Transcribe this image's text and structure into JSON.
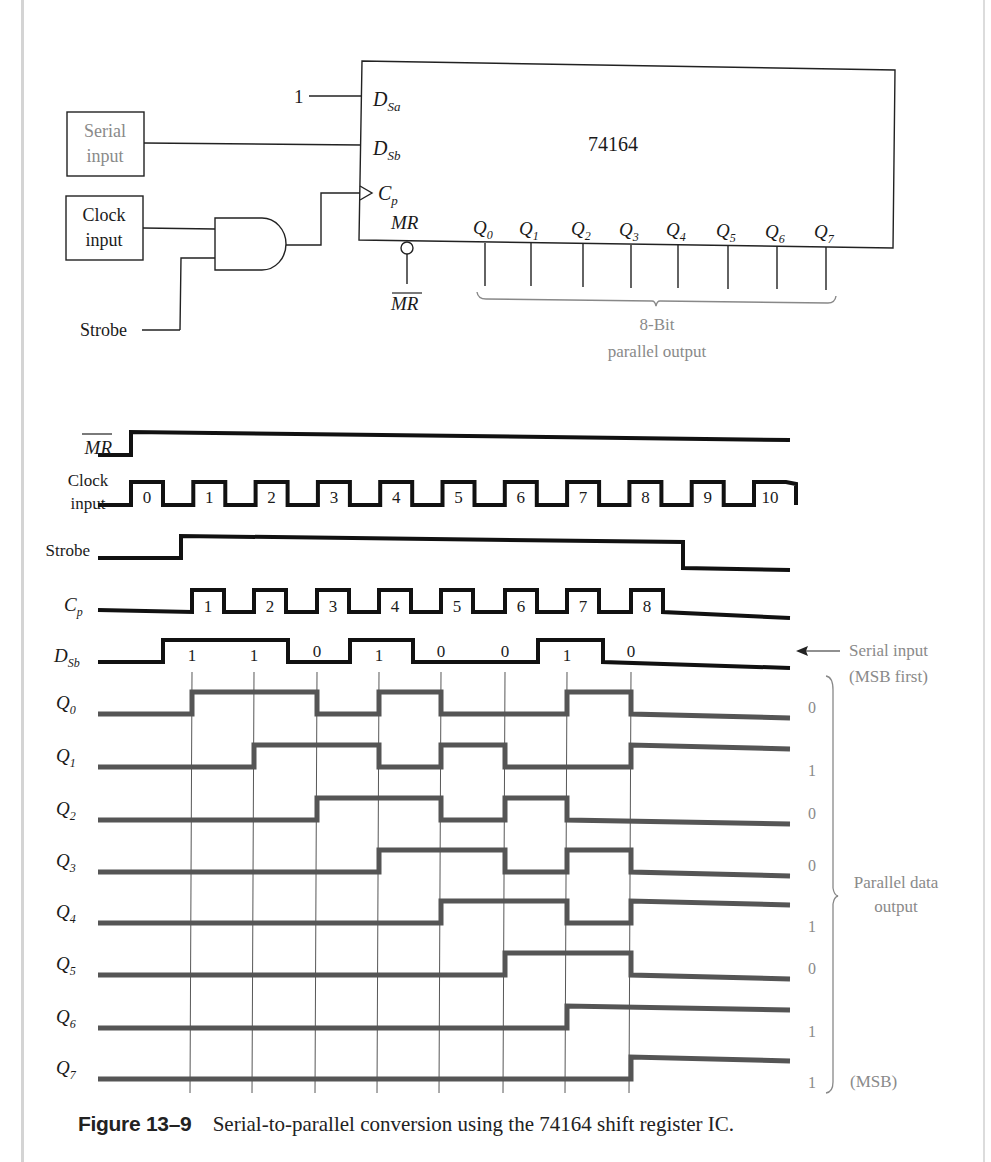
{
  "top_fragment": {
    "left": ".)",
    "right": "Q0)"
  },
  "schematic": {
    "chip_label": "74164",
    "const_input": "1",
    "pins": {
      "dsa": "D",
      "dsa_sub": "Sa",
      "dsb": "D",
      "dsb_sub": "Sb",
      "cp": "C",
      "cp_sub": "p",
      "mr": "MR",
      "mr_bar": "MR"
    },
    "serial_box": [
      "Serial",
      "input"
    ],
    "clock_box": [
      "Clock",
      "input"
    ],
    "strobe_label": "Strobe",
    "outputs": [
      "0",
      "1",
      "2",
      "3",
      "4",
      "5",
      "6",
      "7"
    ],
    "output_brace_label": [
      "8-Bit",
      "parallel output"
    ]
  },
  "timing": {
    "labels": {
      "mr_bar": "MR",
      "clock": [
        "Clock",
        "input"
      ],
      "strobe": "Strobe",
      "cp": "C",
      "cp_sub": "p",
      "dsb": "D",
      "dsb_sub": "Sb"
    },
    "clock_numbers": [
      "0",
      "1",
      "2",
      "3",
      "4",
      "5",
      "6",
      "7",
      "8",
      "9",
      "10"
    ],
    "cp_numbers": [
      "1",
      "2",
      "3",
      "4",
      "5",
      "6",
      "7",
      "8"
    ],
    "dsb_bits": [
      "1",
      "1",
      "0",
      "1",
      "0",
      "0",
      "1",
      "0"
    ],
    "serial_note": [
      "Serial input",
      "(MSB first)"
    ],
    "q_labels": [
      "0",
      "1",
      "2",
      "3",
      "4",
      "5",
      "6",
      "7"
    ],
    "q_final_values": [
      "0",
      "1",
      "0",
      "0",
      "1",
      "0",
      "1",
      "1"
    ],
    "parallel_note": [
      "Parallel data",
      "output"
    ],
    "msb_note": "(MSB)"
  },
  "chart_data": {
    "type": "timing-diagram",
    "title": "Serial-to-parallel conversion using the 74164 shift register IC",
    "cp_edges": 8,
    "serial_input_msb_first": [
      1,
      1,
      0,
      1,
      0,
      0,
      1,
      0
    ],
    "signals": [
      {
        "name": "MR_bar",
        "levels_by_phase": "low then high after start"
      },
      {
        "name": "Clock input",
        "pulses": 11,
        "numbered": "0-10"
      },
      {
        "name": "Strobe",
        "levels": "high from clock pulse 1 through 8"
      },
      {
        "name": "Cp",
        "pulses": 8,
        "numbered": "1-8"
      },
      {
        "name": "DSb",
        "bits": [
          1,
          1,
          0,
          1,
          0,
          0,
          1,
          0
        ]
      },
      {
        "name": "Q0",
        "after_edges": [
          1,
          1,
          0,
          1,
          0,
          0,
          1,
          0
        ]
      },
      {
        "name": "Q1",
        "after_edges": [
          0,
          1,
          1,
          0,
          1,
          0,
          0,
          1
        ]
      },
      {
        "name": "Q2",
        "after_edges": [
          0,
          0,
          1,
          1,
          0,
          1,
          0,
          0
        ]
      },
      {
        "name": "Q3",
        "after_edges": [
          0,
          0,
          0,
          1,
          1,
          0,
          1,
          0
        ]
      },
      {
        "name": "Q4",
        "after_edges": [
          0,
          0,
          0,
          0,
          1,
          1,
          0,
          1
        ]
      },
      {
        "name": "Q5",
        "after_edges": [
          0,
          0,
          0,
          0,
          0,
          1,
          1,
          0
        ]
      },
      {
        "name": "Q6",
        "after_edges": [
          0,
          0,
          0,
          0,
          0,
          0,
          1,
          1
        ]
      },
      {
        "name": "Q7",
        "after_edges": [
          0,
          0,
          0,
          0,
          0,
          0,
          0,
          1
        ]
      }
    ],
    "final_parallel_output": {
      "Q0": 0,
      "Q1": 1,
      "Q2": 0,
      "Q3": 0,
      "Q4": 1,
      "Q5": 0,
      "Q6": 1,
      "Q7": 1
    }
  },
  "caption": {
    "figure": "Figure 13–9",
    "text": "Serial-to-parallel conversion using the 74164 shift register IC."
  }
}
